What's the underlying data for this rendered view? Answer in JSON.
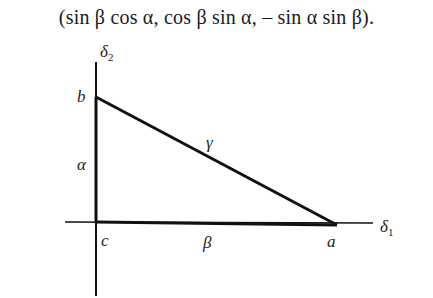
{
  "formula": "(sin  β  cos α, cos β sin α, – sin α sin β).",
  "diagram": {
    "axes": {
      "horizontal": {
        "label": "δ",
        "subscript": "1"
      },
      "vertical": {
        "label": "δ",
        "subscript": "2"
      }
    },
    "vertices": {
      "a": "a",
      "b": "b",
      "c": "c"
    },
    "sides": {
      "alpha": "α",
      "beta": "β",
      "gamma": "γ"
    }
  }
}
